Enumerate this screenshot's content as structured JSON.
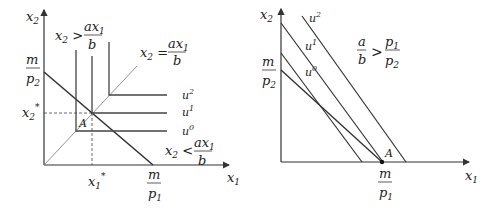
{
  "left_panel": {
    "y_axis_label": "x2",
    "x_axis_label": "x1",
    "intercept_y": {
      "num": "m",
      "den": "p2"
    },
    "intercept_x": {
      "num": "m",
      "den": "p1"
    },
    "x_star": "x1*",
    "y_star": "x2*",
    "point_label": "A",
    "region_above": {
      "lhs": "x2 >",
      "num": "ax1",
      "den": "b"
    },
    "ray_label": {
      "lhs": "x2 =",
      "num": "ax1",
      "den": "b"
    },
    "region_below": {
      "lhs": "x2 <",
      "num": "ax1",
      "den": "b"
    },
    "indifference_curves": [
      "u0",
      "u1",
      "u2"
    ]
  },
  "right_panel": {
    "y_axis_label": "x2",
    "x_axis_label": "x1",
    "intercept_y": {
      "num": "m",
      "den": "p2"
    },
    "intercept_x": {
      "num": "m",
      "den": "p1"
    },
    "point_label": "A",
    "condition": {
      "lhs_num": "a",
      "lhs_den": "b",
      "op": ">",
      "rhs_num": "p1",
      "rhs_den": "p2"
    },
    "indifference_curves": [
      "u0",
      "u1",
      "u2"
    ]
  }
}
